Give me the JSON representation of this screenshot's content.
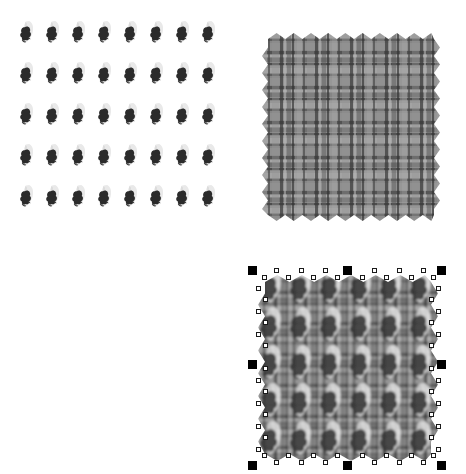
{
  "app": {
    "name": "Vector Graphics Canvas",
    "canvas_background": "#ffffff",
    "width": 466,
    "height": 474
  },
  "palette": {
    "motif_light": "#e9e9e9",
    "motif_light_edge": "#d4d4d4",
    "motif_dark": "#2b2b2b",
    "motif_mid": "#4a4a4a",
    "plaid_base": "#8a8a8a",
    "plaid_light": "#b4b4b4",
    "plaid_mid": "#6e6e6e",
    "plaid_dark": "#3c3c3c",
    "plaid_darkest": "#2a2a2a",
    "handle_major_fill": "#000000",
    "handle_node_fill": "#ffffff",
    "handle_node_stroke": "#1a1a1a"
  },
  "objects": [
    {
      "id": "motif-grid",
      "name": "Motif Pattern Grid",
      "selected": false,
      "x": 18,
      "y": 20,
      "width": 208,
      "height": 212,
      "grid": {
        "columns": 8,
        "rows": 5,
        "cell_width": 26,
        "cell_height": 41
      },
      "motif": {
        "name": "crescent-and-blob",
        "parts": [
          "light-crescent",
          "dark-blob"
        ],
        "light_fill": "#e9e9e9",
        "dark_fill": "#2b2b2b"
      }
    },
    {
      "id": "plaid-swatch",
      "name": "Plaid Fabric Swatch",
      "selected": false,
      "x": 262,
      "y": 33,
      "width": 178,
      "height": 188,
      "edge_style": "pinked-zigzag",
      "zigzag_teeth_x": 10,
      "zigzag_teeth_y": 11,
      "weave": {
        "base": "#8a8a8a",
        "stripe_light": "#b4b4b4",
        "stripe_mid": "#6e6e6e",
        "stripe_dark": "#3c3c3c",
        "stripe_darkest": "#2a2a2a",
        "repeat_px": 35
      }
    },
    {
      "id": "composite-swatch",
      "name": "Plaid Swatch With Motif Overlay",
      "selected": true,
      "x": 258,
      "y": 275,
      "width": 180,
      "height": 186,
      "edge_style": "pinked-zigzag",
      "zigzag_teeth_x": 7,
      "zigzag_teeth_y": 8,
      "overlay_grid": {
        "columns": 6,
        "rows": 5
      },
      "selection": {
        "type": "scale-and-node",
        "major_handle_count": 8,
        "major_handle_size": 9,
        "node_handle_size": 5,
        "bbox": {
          "x": 248,
          "y": 266,
          "width": 197,
          "height": 200
        }
      }
    }
  ],
  "selection_status": {
    "label": "1 object selected",
    "object_name": "Plaid Swatch With Motif Overlay"
  }
}
